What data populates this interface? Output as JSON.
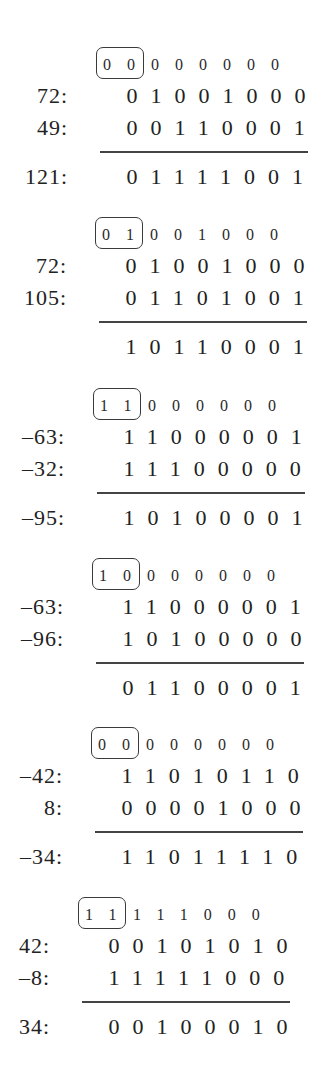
{
  "blocks": [
    {
      "carry_boxed": "00",
      "carry_rest": "000000",
      "operands": [
        {
          "label": "72:",
          "bits": "01001000"
        },
        {
          "label": "49:",
          "bits": "00110001"
        }
      ],
      "result": {
        "label": "121:",
        "bits": "01111001"
      }
    },
    {
      "carry_boxed": "01",
      "carry_rest": "001000",
      "operands": [
        {
          "label": "72:",
          "bits": "01001000"
        },
        {
          "label": "105:",
          "bits": "01101001"
        }
      ],
      "result": {
        "label": "",
        "bits": "10110001"
      }
    },
    {
      "carry_boxed": "11",
      "carry_rest": "000000",
      "operands": [
        {
          "label": "–63:",
          "bits": "11000001"
        },
        {
          "label": "–32:",
          "bits": "11100000"
        }
      ],
      "result": {
        "label": "–95:",
        "bits": "10100001"
      }
    },
    {
      "carry_boxed": "10",
      "carry_rest": "000000",
      "operands": [
        {
          "label": "–63:",
          "bits": "11000001"
        },
        {
          "label": "–96:",
          "bits": "10100000"
        }
      ],
      "result": {
        "label": "",
        "bits": "01100001"
      }
    },
    {
      "carry_boxed": "00",
      "carry_rest": "000000",
      "operands": [
        {
          "label": "–42:",
          "bits": "11010110"
        },
        {
          "label": "8:",
          "bits": "00001000"
        }
      ],
      "result": {
        "label": "–34:",
        "bits": "11011110"
      }
    },
    {
      "carry_boxed": "11",
      "carry_rest": "111000",
      "operands": [
        {
          "label": "42:",
          "bits": "00101010"
        },
        {
          "label": "–8:",
          "bits": "11111000"
        }
      ],
      "result": {
        "label": "34:",
        "bits": "00100010"
      }
    }
  ]
}
